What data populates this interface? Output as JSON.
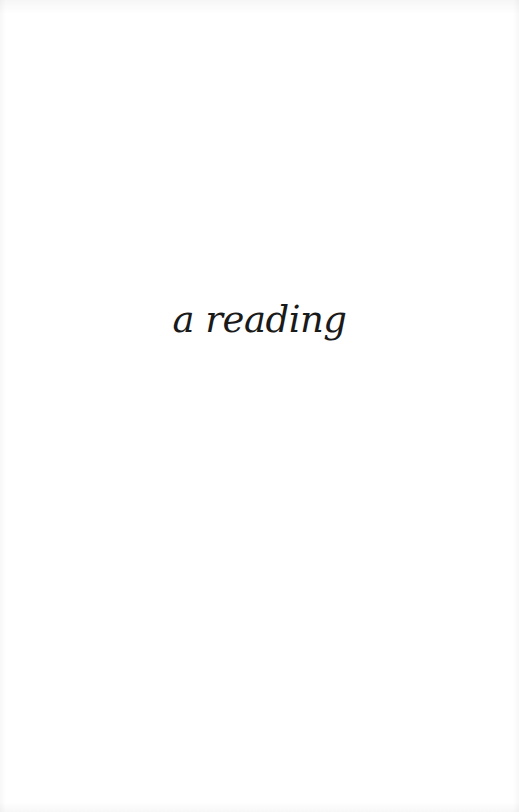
{
  "page": {
    "type": "half-title",
    "title": "a reading"
  }
}
